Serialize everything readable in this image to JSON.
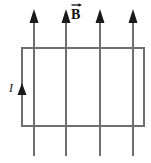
{
  "figure": {
    "type": "physics-diagram",
    "width": 151,
    "height": 163,
    "background_color": "#ffffff",
    "labels": {
      "field_label": "B",
      "field_label_decoration": "vector-arrow-overbar",
      "current_label": "I"
    },
    "colors": {
      "loop_stroke": "#6f6f6f",
      "field_line_stroke": "#6f6f6f",
      "arrowhead_fill": "#1a1a1a",
      "text": "#111111"
    },
    "loop": {
      "shape": "rectangle",
      "x": 22,
      "y": 48,
      "width": 122,
      "height": 78,
      "stroke_width": 2
    },
    "field_lines": {
      "count": 4,
      "direction": "up",
      "top_y": 10,
      "bottom_y": 156,
      "stroke_width": 2,
      "x_positions": [
        34,
        66,
        100,
        133
      ]
    },
    "current_arrow": {
      "x": 22,
      "y": 92,
      "direction": "up",
      "description": "current direction arrowhead on left side of loop"
    }
  }
}
